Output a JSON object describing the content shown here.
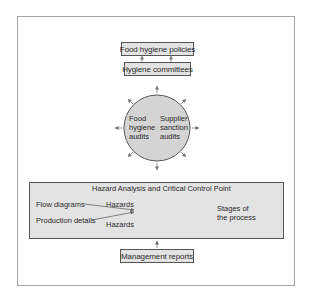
{
  "diagram": {
    "boxes": {
      "policies": "Food hygiene policies",
      "committees": "Hygiene committees",
      "management": "Management reports"
    },
    "circle": {
      "left_text": [
        "Food",
        "hygiene",
        "audits"
      ],
      "right_text": [
        "Supplier",
        "sanction",
        "audits"
      ]
    },
    "haccp": {
      "title": "Hazard Analysis and Critical Control Point",
      "inputs": [
        "Flow diagrams",
        "Production details"
      ],
      "hazards": [
        "Hazards",
        "Hazards"
      ],
      "output": [
        "Stages of",
        "the process"
      ]
    },
    "colors": {
      "box_fill": "#e3e3e3",
      "circle_fill": "#d4d4d4",
      "border": "#555555",
      "frame": "#a6a6a6"
    }
  }
}
